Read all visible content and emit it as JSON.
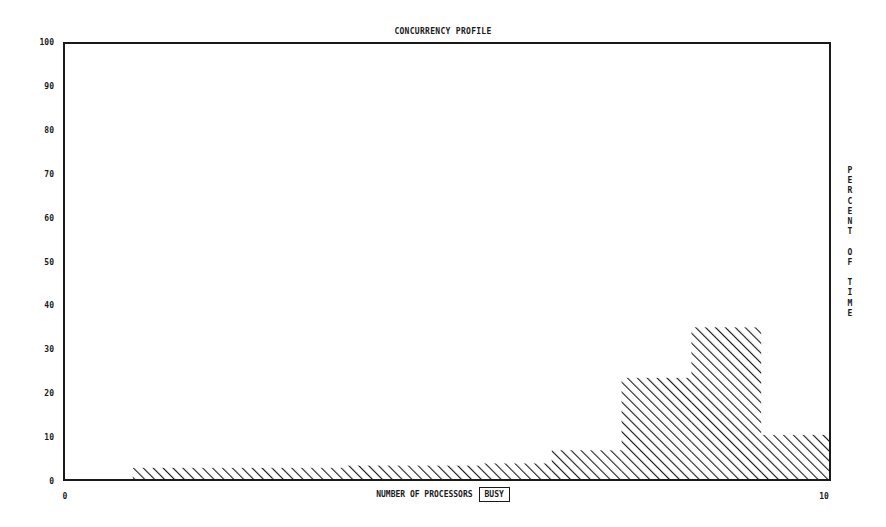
{
  "title": "CONCURRENCY PROFILE",
  "x_axis": {
    "label": "NUMBER OF PROCESSORS",
    "label_box": "BUSY",
    "ticks": [
      "0",
      "10"
    ]
  },
  "y_axis": {
    "label_letters": "PERCENT OF TIME",
    "ticks": [
      "100",
      "90",
      "80",
      "70",
      "60",
      "50",
      "40",
      "30",
      "20",
      "10",
      "0"
    ]
  },
  "colors": {
    "ink": "#1a1a1a",
    "background": "#ffffff"
  },
  "chart_data": {
    "type": "bar",
    "title": "CONCURRENCY PROFILE",
    "xlabel": "NUMBER OF PROCESSORS BUSY",
    "ylabel": "PERCENT OF TIME",
    "categories": [
      "0",
      "1",
      "2",
      "3",
      "4",
      "5",
      "6",
      "7",
      "8",
      "9",
      "10"
    ],
    "values": [
      0,
      3,
      3,
      3,
      3.5,
      3.5,
      4,
      7,
      23.5,
      35,
      10.5
    ],
    "ylim": [
      0,
      100
    ],
    "xlim": [
      0,
      10
    ],
    "yticks": [
      0,
      10,
      20,
      30,
      40,
      50,
      60,
      70,
      80,
      90,
      100
    ],
    "xticks": [
      0,
      10
    ],
    "grid": false,
    "fill": "diagonal-hatch",
    "legend": null
  }
}
